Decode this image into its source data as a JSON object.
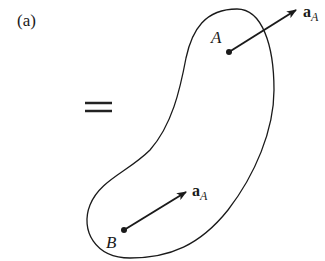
{
  "figure": {
    "part_label": "(a)",
    "equals_sign": "=",
    "body": {
      "point_a": {
        "label": "A"
      },
      "point_b": {
        "label": "B"
      }
    },
    "vectors": {
      "at_a": {
        "symbol": "a",
        "subscript": "A"
      },
      "at_b": {
        "symbol": "a",
        "subscript": "A"
      }
    },
    "colors": {
      "ink": "#1a1a1a",
      "background": "#ffffff"
    }
  }
}
